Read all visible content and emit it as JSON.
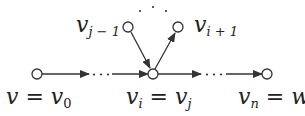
{
  "diagram": {
    "type": "path graph with repeated vertex (cycle)",
    "colors": {
      "stroke": "#333333",
      "node_fill": "#ffffff",
      "text": "#222222"
    },
    "nodes": [
      {
        "id": "v0",
        "label": "v",
        "eq": " = ",
        "label2": "v",
        "sub2": "0"
      },
      {
        "id": "vi",
        "label": "v",
        "sub": "i",
        "eq": " = ",
        "label2": "v",
        "sub2": "j"
      },
      {
        "id": "vn",
        "label": "v",
        "sub": "n",
        "eq": " = ",
        "label2": "w"
      },
      {
        "id": "vj-1",
        "label": "v",
        "sub": "j − 1"
      },
      {
        "id": "vi+1",
        "label": "v",
        "sub": "i + 1"
      }
    ],
    "edges": [
      {
        "from": "v0",
        "to": "dots-left"
      },
      {
        "from": "dots-left",
        "to": "vi"
      },
      {
        "from": "vj-1",
        "to": "vi"
      },
      {
        "from": "vi",
        "to": "vi+1"
      },
      {
        "from": "vi",
        "to": "dots-right"
      },
      {
        "from": "dots-right",
        "to": "vn"
      }
    ],
    "ellipsis": "· · ·"
  }
}
